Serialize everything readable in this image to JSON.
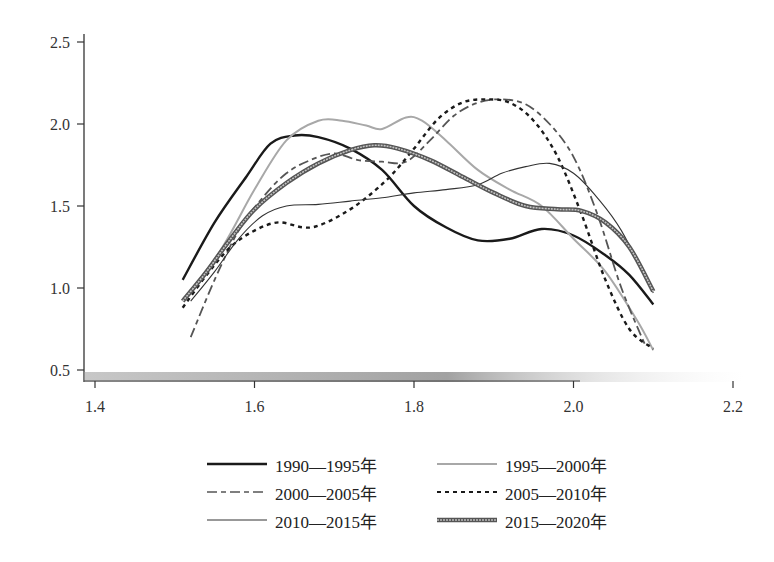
{
  "chart_data": {
    "type": "line",
    "title": "",
    "xlabel": "",
    "ylabel": "",
    "xlim": [
      1.4,
      2.2
    ],
    "ylim": [
      0.5,
      2.5
    ],
    "xticks": [
      "1.4",
      "1.6",
      "1.8",
      "2.0",
      "2.2"
    ],
    "yticks": [
      "0.5",
      "1.0",
      "1.5",
      "2.0",
      "2.5"
    ],
    "grid": false,
    "legend_position": "bottom",
    "series": [
      {
        "name": "1990—1995年",
        "style": "solid-thick",
        "color": "#1a1a1a",
        "x": [
          1.51,
          1.55,
          1.59,
          1.62,
          1.65,
          1.68,
          1.72,
          1.76,
          1.8,
          1.84,
          1.88,
          1.92,
          1.96,
          2.0,
          2.04,
          2.07,
          2.1
        ],
        "y": [
          1.05,
          1.4,
          1.68,
          1.88,
          1.93,
          1.92,
          1.85,
          1.72,
          1.5,
          1.37,
          1.29,
          1.3,
          1.36,
          1.32,
          1.2,
          1.08,
          0.9
        ]
      },
      {
        "name": "1995—2000年",
        "style": "solid-light",
        "color": "#a8a8a8",
        "x": [
          1.52,
          1.56,
          1.6,
          1.64,
          1.68,
          1.71,
          1.74,
          1.76,
          1.79,
          1.81,
          1.84,
          1.88,
          1.92,
          1.96,
          2.0,
          2.04,
          2.08,
          2.1
        ],
        "y": [
          0.98,
          1.25,
          1.6,
          1.9,
          2.02,
          2.02,
          1.99,
          1.97,
          2.04,
          2.02,
          1.9,
          1.72,
          1.6,
          1.5,
          1.3,
          1.1,
          0.8,
          0.62
        ]
      },
      {
        "name": "2000—2005年",
        "style": "dash-dot",
        "color": "#555555",
        "x": [
          1.52,
          1.55,
          1.58,
          1.61,
          1.64,
          1.67,
          1.7,
          1.73,
          1.76,
          1.79,
          1.82,
          1.85,
          1.88,
          1.91,
          1.94,
          1.97,
          2.0,
          2.03,
          2.06,
          2.09
        ],
        "y": [
          0.7,
          1.05,
          1.35,
          1.55,
          1.7,
          1.78,
          1.82,
          1.78,
          1.77,
          1.77,
          1.9,
          2.05,
          2.13,
          2.15,
          2.12,
          2.0,
          1.8,
          1.45,
          1.0,
          0.65
        ]
      },
      {
        "name": "2005—2010年",
        "style": "dotted",
        "color": "#1a1a1a",
        "x": [
          1.51,
          1.54,
          1.57,
          1.6,
          1.63,
          1.66,
          1.68,
          1.71,
          1.74,
          1.77,
          1.8,
          1.83,
          1.86,
          1.89,
          1.92,
          1.95,
          1.98,
          2.01,
          2.04,
          2.07,
          2.1
        ],
        "y": [
          0.88,
          1.08,
          1.25,
          1.35,
          1.4,
          1.37,
          1.38,
          1.45,
          1.55,
          1.68,
          1.85,
          2.03,
          2.13,
          2.15,
          2.13,
          2.02,
          1.8,
          1.45,
          1.05,
          0.75,
          0.63
        ]
      },
      {
        "name": "2010—2015年",
        "style": "solid-thin",
        "color": "#333333",
        "x": [
          1.52,
          1.55,
          1.58,
          1.61,
          1.64,
          1.68,
          1.72,
          1.76,
          1.8,
          1.84,
          1.88,
          1.91,
          1.94,
          1.97,
          2.0,
          2.03,
          2.06,
          2.1
        ],
        "y": [
          0.92,
          1.1,
          1.3,
          1.44,
          1.5,
          1.51,
          1.53,
          1.55,
          1.58,
          1.6,
          1.63,
          1.7,
          1.74,
          1.76,
          1.7,
          1.55,
          1.35,
          0.97
        ]
      },
      {
        "name": "2015—2020年",
        "style": "double-band",
        "color": "#666666",
        "x": [
          1.51,
          1.54,
          1.57,
          1.6,
          1.64,
          1.68,
          1.72,
          1.75,
          1.78,
          1.82,
          1.86,
          1.9,
          1.94,
          1.98,
          2.01,
          2.04,
          2.07,
          2.1
        ],
        "y": [
          0.92,
          1.1,
          1.3,
          1.48,
          1.64,
          1.76,
          1.84,
          1.87,
          1.85,
          1.78,
          1.68,
          1.58,
          1.5,
          1.48,
          1.47,
          1.4,
          1.25,
          0.98
        ]
      }
    ]
  }
}
